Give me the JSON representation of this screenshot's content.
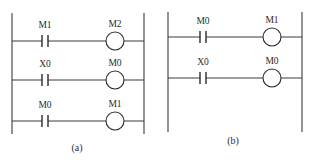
{
  "diagram": {
    "colors": {
      "line": "#3a3a3a",
      "text": "#2a2a2a",
      "background": "#ffffff"
    },
    "panels": [
      {
        "id": "a",
        "caption": "(a)",
        "caption_pos": [
          77,
          151
        ],
        "left_rail_x": 12,
        "right_rail_x": 144,
        "rail_top": 13,
        "rail_bottom": 134,
        "contact_x": 45,
        "coil_cx": 115,
        "coil_r": 9,
        "rungs": [
          {
            "y": 41,
            "contact": {
              "type": "normally-open",
              "label": "M1"
            },
            "coil": {
              "label": "M2"
            }
          },
          {
            "y": 80,
            "contact": {
              "type": "normally-open",
              "label": "X0"
            },
            "coil": {
              "label": "M0"
            }
          },
          {
            "y": 121,
            "contact": {
              "type": "normally-open",
              "label": "M0"
            },
            "coil": {
              "label": "M1"
            }
          }
        ]
      },
      {
        "id": "b",
        "caption": "(b)",
        "caption_pos": [
          233,
          144
        ],
        "left_rail_x": 168,
        "right_rail_x": 302,
        "rail_top": 12,
        "rail_bottom": 132,
        "contact_x": 203,
        "coil_cx": 272,
        "coil_r": 9,
        "rungs": [
          {
            "y": 37,
            "contact": {
              "type": "normally-open",
              "label": "M0"
            },
            "coil": {
              "label": "M1"
            }
          },
          {
            "y": 78,
            "contact": {
              "type": "normally-open",
              "label": "X0"
            },
            "coil": {
              "label": "M0"
            }
          }
        ]
      }
    ]
  }
}
